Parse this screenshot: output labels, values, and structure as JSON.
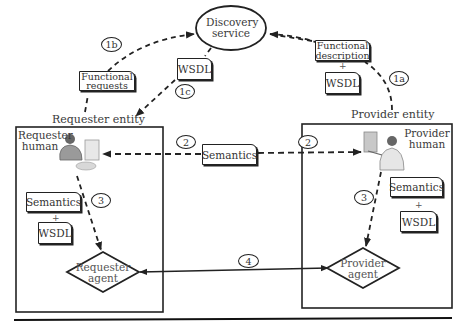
{
  "discovery": {
    "label_line1": "Discovery",
    "label_line2": "service"
  },
  "requester": {
    "entity_label": "Requester entity",
    "human_label_line1": "Requester",
    "human_label_line2": "human",
    "doc_semantics": "Semantics",
    "plus": "+",
    "doc_wsdl": "WSDL",
    "agent_line1": "Requester",
    "agent_line2": "agent"
  },
  "provider": {
    "entity_label": "Provider entity",
    "human_label_line1": "Provider",
    "human_label_line2": "human",
    "doc_semantics": "Semantics",
    "plus": "+",
    "doc_wsdl": "WSDL",
    "agent_line1": "Provider",
    "agent_line2": "agent"
  },
  "flows": {
    "functional_requests_line1": "Functional",
    "functional_requests_line2": "requests",
    "wsdl_discovery": "WSDL",
    "functional_description_line1": "Functional",
    "functional_description_line2": "description",
    "fd_plus": "+",
    "fd_wsdl": "WSDL",
    "semantics_center": "Semantics"
  },
  "steps": {
    "s1a": "1a",
    "s1b": "1b",
    "s1c": "1c",
    "s2_left": "2",
    "s2_right": "2",
    "s3_left": "3",
    "s3_right": "3",
    "s4": "4"
  },
  "colors": {
    "line": "#222222",
    "text": "#3a3a3a",
    "background": "#ffffff"
  }
}
